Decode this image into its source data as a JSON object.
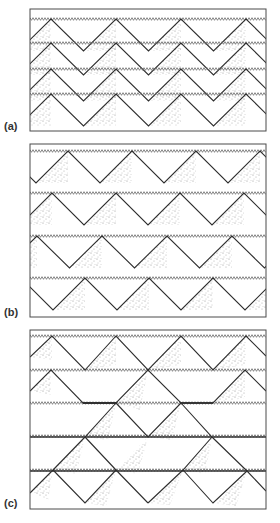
{
  "figure": {
    "width": 279,
    "height": 523,
    "colors": {
      "frame": "#4a4a4a",
      "zigzag_line": "#2e2e2e",
      "serration": "#6a6a6a",
      "thick_line": "#333333",
      "stipple": "#7a7a7a",
      "label": "#333333"
    },
    "serration": {
      "period": 3,
      "amplitude": 2.6
    },
    "wave_tail": 21
  },
  "panels": [
    {
      "id": "a",
      "label": "(a)",
      "label_pos": {
        "x": 4,
        "y": 120
      },
      "box": {
        "x": 30,
        "y": 9,
        "w": 236,
        "h": 122
      },
      "type": "periodic",
      "amplitude": 32,
      "rows": [
        {
          "line_y": 19,
          "peaks": [
            51,
            116,
            180,
            245
          ]
        },
        {
          "line_y": 43,
          "peaks": [
            51,
            116,
            180,
            245
          ]
        },
        {
          "line_y": 69,
          "peaks": [
            51,
            116,
            180,
            245
          ]
        },
        {
          "line_y": 94,
          "peaks": [
            51,
            116,
            180,
            245
          ]
        }
      ]
    },
    {
      "id": "b",
      "label": "(b)",
      "label_pos": {
        "x": 4,
        "y": 306
      },
      "box": {
        "x": 30,
        "y": 144,
        "w": 236,
        "h": 173
      },
      "type": "periodic",
      "amplitude": 32,
      "rows": [
        {
          "line_y": 151,
          "peaks": [
            4,
            68,
            133,
            198,
            263
          ]
        },
        {
          "line_y": 193,
          "peaks": [
            52,
            116,
            182,
            247
          ]
        },
        {
          "line_y": 236,
          "peaks": [
            37,
            102,
            166,
            230,
            295
          ]
        },
        {
          "line_y": 278,
          "peaks": [
            21,
            85,
            150,
            214,
            279
          ]
        }
      ]
    },
    {
      "id": "c",
      "label": "(c)",
      "label_pos": {
        "x": 4,
        "y": 497
      },
      "box": {
        "x": 30,
        "y": 330,
        "w": 236,
        "h": 179
      },
      "type": "segments",
      "serrated_lines": [
        336,
        370,
        403
      ],
      "thick_lines": [
        437,
        471
      ],
      "polylines": [
        [
          [
            30,
            357
          ],
          [
            52,
            336
          ],
          [
            85,
            370
          ],
          [
            116,
            336
          ],
          [
            148,
            370
          ],
          [
            181,
            336
          ],
          [
            213,
            370
          ],
          [
            246,
            336
          ],
          [
            266,
            356
          ]
        ],
        [
          [
            30,
            391
          ],
          [
            51,
            370
          ],
          [
            83,
            403
          ],
          [
            116,
            403
          ],
          [
            148,
            370
          ],
          [
            181,
            403
          ],
          [
            213,
            403
          ],
          [
            245,
            370
          ],
          [
            266,
            391
          ]
        ],
        [
          [
            116,
            403
          ],
          [
            148,
            437
          ],
          [
            181,
            403
          ]
        ],
        [
          [
            116,
            403
          ],
          [
            85,
            437
          ],
          [
            53,
            470
          ],
          [
            31,
            492
          ]
        ],
        [
          [
            181,
            403
          ],
          [
            212,
            437
          ],
          [
            247,
            471
          ],
          [
            266,
            491
          ]
        ],
        [
          [
            85,
            437
          ],
          [
            116,
            470
          ],
          [
            148,
            503
          ]
        ],
        [
          [
            53,
            470
          ],
          [
            85,
            503
          ],
          [
            116,
            470
          ]
        ],
        [
          [
            212,
            437
          ],
          [
            183,
            470
          ],
          [
            148,
            503
          ]
        ],
        [
          [
            183,
            470
          ],
          [
            213,
            503
          ],
          [
            247,
            471
          ]
        ],
        [
          [
            31,
            492
          ],
          [
            30,
            493
          ]
        ]
      ],
      "thick_runs": [
        [
          [
            83,
            403
          ],
          [
            116,
            403
          ]
        ],
        [
          [
            181,
            403
          ],
          [
            213,
            403
          ]
        ]
      ],
      "stipple_triangles": [
        [
          [
            30,
            357
          ],
          [
            52,
            336
          ],
          [
            52,
            360
          ]
        ],
        [
          [
            85,
            370
          ],
          [
            116,
            336
          ],
          [
            116,
            365
          ]
        ],
        [
          [
            148,
            370
          ],
          [
            181,
            336
          ],
          [
            181,
            365
          ]
        ],
        [
          [
            213,
            370
          ],
          [
            246,
            336
          ],
          [
            246,
            365
          ]
        ],
        [
          [
            30,
            391
          ],
          [
            51,
            370
          ],
          [
            51,
            395
          ]
        ],
        [
          [
            213,
            403
          ],
          [
            245,
            370
          ],
          [
            245,
            398
          ]
        ],
        [
          [
            148,
            370
          ],
          [
            116,
            403
          ],
          [
            140,
            410
          ]
        ],
        [
          [
            116,
            403
          ],
          [
            85,
            437
          ],
          [
            108,
            440
          ]
        ],
        [
          [
            85,
            437
          ],
          [
            53,
            470
          ],
          [
            76,
            474
          ]
        ],
        [
          [
            53,
            470
          ],
          [
            31,
            492
          ],
          [
            48,
            500
          ]
        ],
        [
          [
            181,
            403
          ],
          [
            148,
            437
          ],
          [
            172,
            440
          ]
        ],
        [
          [
            212,
            437
          ],
          [
            183,
            470
          ],
          [
            205,
            474
          ]
        ],
        [
          [
            183,
            470
          ],
          [
            148,
            503
          ],
          [
            170,
            505
          ]
        ],
        [
          [
            116,
            470
          ],
          [
            85,
            503
          ],
          [
            106,
            506
          ]
        ],
        [
          [
            247,
            471
          ],
          [
            213,
            503
          ],
          [
            236,
            506
          ]
        ],
        [
          [
            148,
            437
          ],
          [
            116,
            470
          ],
          [
            138,
            474
          ]
        ]
      ]
    }
  ]
}
